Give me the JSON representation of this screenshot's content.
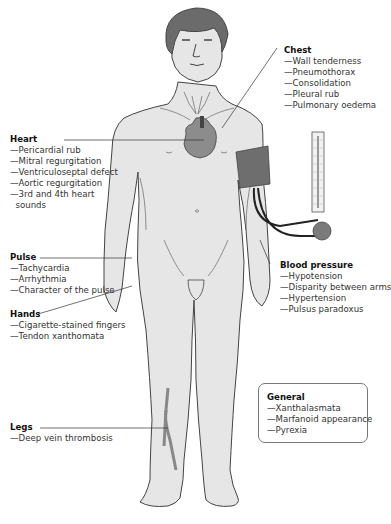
{
  "figure": {
    "colors": {
      "skin": "#e6e6e6",
      "hair": "#6b6b6b",
      "heart": "#8c8c8c",
      "cuff": "#6e6e6e",
      "outline": "#444444",
      "text": "#333333"
    }
  },
  "annotations": {
    "chest": {
      "title": "Chest",
      "items": [
        "—Wall tenderness",
        "—Pneumothorax",
        "—Consolidation",
        "—Pleural rub",
        "—Pulmonary oedema"
      ]
    },
    "heart": {
      "title": "Heart",
      "items": [
        "—Pericardial rub",
        "—Mitral regurgitation",
        "—Ventriculoseptal defect",
        "—Aortic regurgitation",
        "—3rd and 4th heart",
        "  sounds"
      ]
    },
    "pulse": {
      "title": "Pulse",
      "items": [
        "—Tachycardia",
        "—Arrhythmia",
        "—Character of the pulse"
      ]
    },
    "hands": {
      "title": "Hands",
      "items": [
        "—Cigarette-stained fingers",
        "—Tendon xanthomata"
      ]
    },
    "blood_pressure": {
      "title": "Blood pressure",
      "items": [
        "—Hypotension",
        "—Disparity between arms",
        "—Hypertension",
        "—Pulsus paradoxus"
      ]
    },
    "general": {
      "title": "General",
      "items": [
        "—Xanthalasmata",
        "—Marfanoid appearance",
        "—Pyrexia"
      ]
    },
    "legs": {
      "title": "Legs",
      "items": [
        "—Deep vein thrombosis"
      ]
    }
  }
}
